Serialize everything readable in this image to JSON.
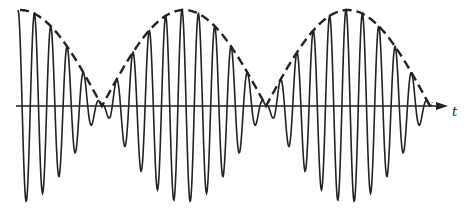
{
  "diagram": {
    "type": "amplitude-modulated wave (beats)",
    "axis": {
      "label": "t",
      "y": 106,
      "x_start": 16,
      "x_end": 440
    },
    "envelope": {
      "style": "dashed",
      "nodes_x": [
        102,
        266,
        430
      ],
      "peaks_x": [
        20,
        185,
        352
      ],
      "peak_y": 10
    },
    "carrier": {
      "period_px": 16.4,
      "amplitude_px": 95,
      "start_x": 18
    },
    "colors": {
      "stroke": "#222222",
      "background": "#ffffff"
    }
  }
}
